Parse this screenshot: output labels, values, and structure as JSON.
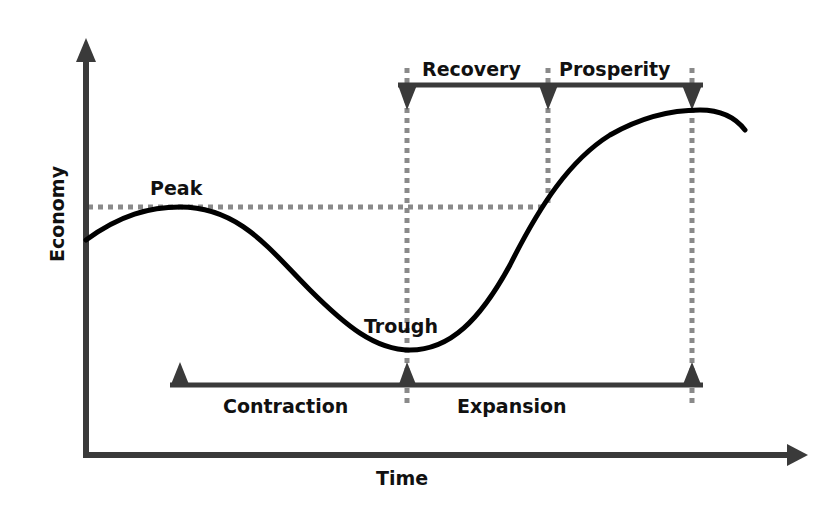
{
  "diagram": {
    "axes": {
      "x_label": "Time",
      "y_label": "Economy"
    },
    "curve_labels": {
      "peak": "Peak",
      "trough": "Trough"
    },
    "phases_top": {
      "recovery": "Recovery",
      "prosperity": "Prosperity"
    },
    "phases_bottom": {
      "contraction": "Contraction",
      "expansion": "Expansion"
    },
    "colors": {
      "curve": "#000000",
      "axis": "#3a3a3a",
      "guide": "#8a8a8a",
      "text": "#111111"
    }
  }
}
